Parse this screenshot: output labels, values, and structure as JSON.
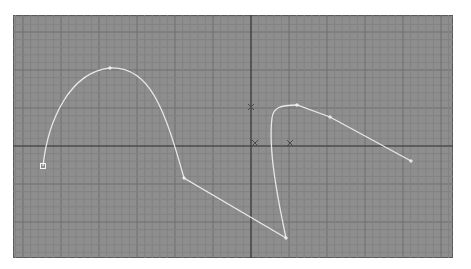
{
  "viewport": {
    "name": "perspective-viewport",
    "left": 13,
    "top": 15,
    "width": 440,
    "height": 243,
    "background": "#8e8e8e",
    "grid": {
      "minor_color": "#838383",
      "major_color": "#6f6f6f",
      "minor_spacing": 7.6,
      "major_every": 5
    },
    "axes": {
      "x_axis_y": 146,
      "y_axis_x": 251,
      "color": "#3a3a3a"
    }
  },
  "spline": {
    "name": "bezier-spline",
    "color": "#e8e8e8",
    "path": "M43,166 C48,120 70,72 110,68 C150,66 165,110 184,178 L286,238 C278,200 268,150 272,118 C273,108 280,105 297,105 L330,117 L411,161",
    "vertices": [
      {
        "id": "v0",
        "x": 43,
        "y": 166,
        "type": "first-vertex"
      },
      {
        "id": "v1",
        "x": 110,
        "y": 68,
        "type": "vertex"
      },
      {
        "id": "v2",
        "x": 184,
        "y": 178,
        "type": "vertex"
      },
      {
        "id": "v3",
        "x": 286,
        "y": 238,
        "type": "vertex"
      },
      {
        "id": "v4",
        "x": 297,
        "y": 105,
        "type": "vertex"
      },
      {
        "id": "v5",
        "x": 330,
        "y": 117,
        "type": "vertex"
      },
      {
        "id": "v6",
        "x": 411,
        "y": 161,
        "type": "vertex"
      }
    ]
  },
  "markers": [
    {
      "name": "pivot-marker",
      "x": 251,
      "y": 107
    },
    {
      "name": "origin-marker",
      "x": 255,
      "y": 143
    },
    {
      "name": "transform-gizmo",
      "x": 290,
      "y": 143
    }
  ]
}
